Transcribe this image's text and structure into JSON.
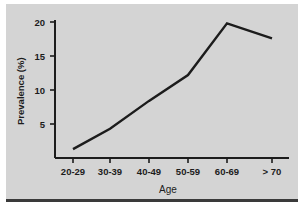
{
  "figure": {
    "background_color": "#d4d4d4",
    "page_color": "#ffffff",
    "line_color": "#1c1c1c",
    "axis_color": "#1c1c1c",
    "rule_color": "#3a3a3a"
  },
  "chart_data": {
    "type": "line",
    "title": "",
    "xlabel": "Age",
    "ylabel": "Prevalence (%)",
    "categories": [
      "20-29",
      "30-39",
      "40-49",
      "50-59",
      "60-69",
      "> 70"
    ],
    "values": [
      1.3,
      4.3,
      8.4,
      12.2,
      19.8,
      17.6
    ],
    "series": [
      {
        "name": "Prevalence",
        "values": [
          1.3,
          4.3,
          8.4,
          12.2,
          19.8,
          17.6
        ]
      }
    ],
    "ylim": [
      0,
      20.6
    ],
    "yticks": [
      5,
      10,
      15,
      20
    ],
    "ytick_labels": [
      "5",
      "10",
      "15",
      "20"
    ],
    "xtick_labels": [
      "20-29",
      "30-39",
      "40-49",
      "50-59",
      "60-69",
      "> 70"
    ],
    "grid": false,
    "legend": false,
    "legend_position": "none",
    "markers": false,
    "line_width": 2.4
  },
  "axes": {
    "y_label": "Prevalence (%)",
    "x_label": "Age",
    "y_tick_0": "5",
    "y_tick_1": "10",
    "y_tick_2": "15",
    "y_tick_3": "20",
    "x_tick_0": "20-29",
    "x_tick_1": "30-39",
    "x_tick_2": "40-49",
    "x_tick_3": "50-59",
    "x_tick_4": "60-69",
    "x_tick_5": "> 70"
  }
}
